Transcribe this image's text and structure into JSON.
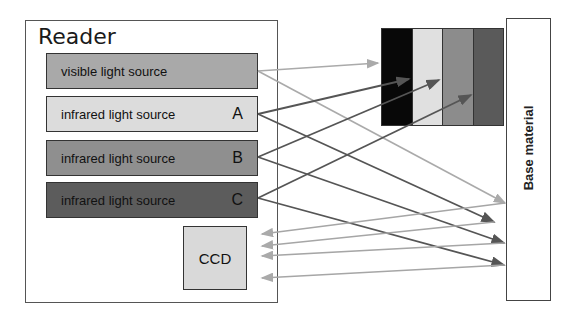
{
  "reader": {
    "title": "Reader",
    "sources": [
      {
        "label": "visible light source",
        "letter": "",
        "color": "#a9a9a9"
      },
      {
        "label": "infrared light source",
        "letter": "A",
        "color": "#dcdcdc"
      },
      {
        "label": "infrared light source",
        "letter": "B",
        "color": "#8f8f8f"
      },
      {
        "label": "infrared light source",
        "letter": "C",
        "color": "#5c5c5c"
      }
    ],
    "ccd": {
      "label": "CCD",
      "color": "#d9d9d9"
    }
  },
  "target": {
    "stripes": [
      "#080808",
      "#e0e0e0",
      "#8c8c8c",
      "#5a5a5a"
    ],
    "base_label": "Base material"
  },
  "arrows": {
    "incident_color_visible": "#aaaaaa",
    "incident_color_ir": "#555555",
    "reflected_color": "#a6a6a6"
  }
}
